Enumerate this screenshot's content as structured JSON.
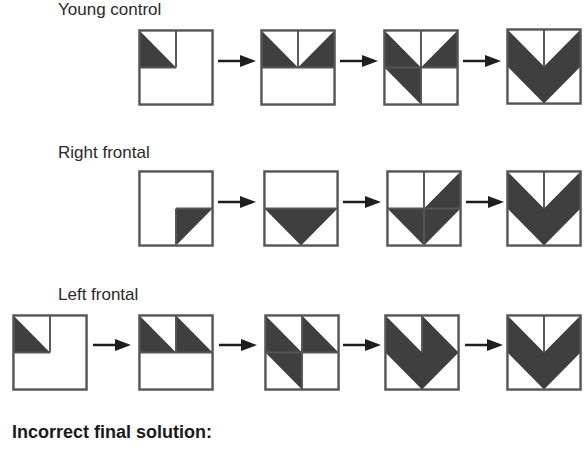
{
  "colors": {
    "fill": "#3f3f3f",
    "stroke": "#555555",
    "arrow": "#1e1e1e"
  },
  "rows": [
    {
      "label": "Young control",
      "label_pos": {
        "x": 58,
        "y": 0
      },
      "panels": [
        {
          "x": 138,
          "y": 29,
          "shape": "tl-triangle",
          "lines": [
            "v-top",
            "h-left"
          ]
        },
        {
          "x": 260,
          "y": 29,
          "shape": "two-top-inward",
          "lines": [
            "v-top",
            "h-full"
          ]
        },
        {
          "x": 383,
          "y": 29,
          "shape": "left-para-plus-tr",
          "lines": [
            "v-full",
            "h-full"
          ]
        },
        {
          "x": 506,
          "y": 28,
          "shape": "v-chevron",
          "lines": [
            "v-top"
          ]
        }
      ],
      "arrows": [
        {
          "x": 218,
          "y": 61
        },
        {
          "x": 340,
          "y": 61
        },
        {
          "x": 463,
          "y": 61
        }
      ]
    },
    {
      "label": "Right frontal",
      "label_pos": {
        "x": 58,
        "y": 143
      },
      "panels": [
        {
          "x": 138,
          "y": 170,
          "shape": "br-triangle",
          "lines": [
            "h-right",
            "v-bottom"
          ]
        },
        {
          "x": 263,
          "y": 170,
          "shape": "down-triangle",
          "lines": [
            "h-full"
          ]
        },
        {
          "x": 386,
          "y": 170,
          "shape": "check",
          "lines": [
            "v-full",
            "h-full"
          ]
        },
        {
          "x": 506,
          "y": 170,
          "shape": "v-chevron",
          "lines": [
            "v-top"
          ]
        }
      ],
      "arrows": [
        {
          "x": 218,
          "y": 202
        },
        {
          "x": 343,
          "y": 202
        },
        {
          "x": 466,
          "y": 202
        }
      ]
    },
    {
      "label": "Left frontal",
      "label_pos": {
        "x": 58,
        "y": 285
      },
      "panels": [
        {
          "x": 12,
          "y": 314,
          "shape": "tl-triangle",
          "lines": [
            "v-top",
            "h-left"
          ]
        },
        {
          "x": 138,
          "y": 314,
          "shape": "two-top-same",
          "lines": [
            "v-top",
            "h-full"
          ]
        },
        {
          "x": 264,
          "y": 314,
          "shape": "left-para-plus-tr-same",
          "lines": [
            "v-full",
            "h-full"
          ]
        },
        {
          "x": 384,
          "y": 314,
          "shape": "double-notch",
          "lines": [
            "v-top"
          ]
        },
        {
          "x": 506,
          "y": 314,
          "shape": "v-chevron",
          "lines": [
            "v-top"
          ]
        }
      ],
      "arrows": [
        {
          "x": 93,
          "y": 345
        },
        {
          "x": 219,
          "y": 345
        },
        {
          "x": 343,
          "y": 345
        },
        {
          "x": 465,
          "y": 345
        }
      ]
    }
  ],
  "footer": {
    "label": "Incorrect final solution:"
  }
}
